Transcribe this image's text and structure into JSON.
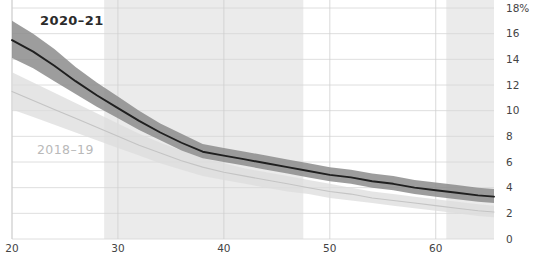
{
  "chart_data": {
    "type": "line",
    "title": "",
    "subtitle": "",
    "xlabel": "",
    "ylabel": "",
    "xlim": [
      20,
      65.5
    ],
    "ylim": [
      0,
      18
    ],
    "grid": true,
    "legend_position": "inline-annotation",
    "y_unit": "%",
    "y_ticks": [
      0,
      2,
      4,
      6,
      8,
      10,
      12,
      14,
      16,
      18
    ],
    "y_tick_labels": [
      "0",
      "2",
      "4",
      "6",
      "8",
      "10",
      "12",
      "14",
      "16",
      "18%"
    ],
    "x_ticks": [
      20,
      30,
      40,
      50,
      60
    ],
    "x_tick_labels": [
      "20",
      "30",
      "40",
      "50",
      "60"
    ],
    "shaded_x_bands": [
      [
        28.7,
        47.5
      ],
      [
        61.0,
        65.5
      ]
    ],
    "series": [
      {
        "name": "2020-21",
        "label": "2020–21",
        "color": "#1f1f1f",
        "band_color": "#8c8c8c",
        "label_color": "#2b2b2b",
        "x": [
          20,
          22,
          24,
          26,
          28,
          30,
          32,
          34,
          36,
          38,
          40,
          42,
          44,
          46,
          48,
          50,
          52,
          54,
          56,
          58,
          60,
          62,
          64,
          65.5
        ],
        "values": [
          15.5,
          14.6,
          13.5,
          12.3,
          11.2,
          10.2,
          9.2,
          8.3,
          7.5,
          6.8,
          6.5,
          6.2,
          5.9,
          5.6,
          5.3,
          5.0,
          4.8,
          4.5,
          4.3,
          4.0,
          3.8,
          3.6,
          3.4,
          3.3
        ],
        "band_low": [
          14.1,
          13.3,
          12.3,
          11.3,
          10.3,
          9.4,
          8.5,
          7.7,
          6.9,
          6.3,
          6.0,
          5.7,
          5.4,
          5.1,
          4.8,
          4.5,
          4.3,
          4.0,
          3.8,
          3.5,
          3.3,
          3.1,
          2.9,
          2.8
        ],
        "band_high": [
          17.0,
          16.0,
          14.8,
          13.4,
          12.2,
          11.1,
          10.0,
          9.0,
          8.2,
          7.4,
          7.1,
          6.8,
          6.5,
          6.2,
          5.9,
          5.6,
          5.4,
          5.1,
          4.9,
          4.6,
          4.4,
          4.2,
          4.0,
          3.9
        ]
      },
      {
        "name": "2018-19",
        "label": "2018–19",
        "color": "#c4c4c4",
        "band_color": "#dcdcdc",
        "label_color": "#b9b9b9",
        "x": [
          20,
          22,
          24,
          26,
          28,
          30,
          32,
          34,
          36,
          38,
          40,
          42,
          44,
          46,
          48,
          50,
          52,
          54,
          56,
          58,
          60,
          62,
          64,
          65.5
        ],
        "values": [
          11.5,
          10.8,
          10.1,
          9.4,
          8.7,
          8.0,
          7.3,
          6.7,
          6.1,
          5.6,
          5.2,
          4.9,
          4.6,
          4.3,
          4.0,
          3.7,
          3.5,
          3.2,
          3.0,
          2.8,
          2.6,
          2.4,
          2.2,
          2.1
        ],
        "band_low": [
          10.1,
          9.5,
          8.9,
          8.3,
          7.7,
          7.1,
          6.5,
          5.9,
          5.4,
          4.9,
          4.6,
          4.3,
          4.0,
          3.7,
          3.5,
          3.2,
          3.0,
          2.8,
          2.6,
          2.4,
          2.2,
          2.0,
          1.8,
          1.7
        ],
        "band_high": [
          13.0,
          12.2,
          11.4,
          10.6,
          9.8,
          9.0,
          8.2,
          7.5,
          6.9,
          6.3,
          5.9,
          5.5,
          5.2,
          4.9,
          4.6,
          4.3,
          4.0,
          3.7,
          3.5,
          3.3,
          3.1,
          2.9,
          2.7,
          2.6
        ]
      }
    ]
  },
  "axes": {
    "y_axis_name": "percentage-axis",
    "x_axis_name": "age-axis"
  }
}
